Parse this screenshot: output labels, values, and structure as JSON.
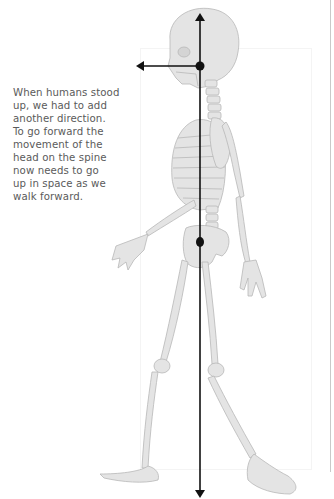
{
  "caption": {
    "text": "When humans stood\nup, we had to add\nanother direction.\nTo go forward the\nmovement of the\nhead on the spine\nnow needs to go\nup in space as we\nwalk forward."
  },
  "figure": {
    "bone_color": "#e2e2e2",
    "bone_outline": "#b8b8b8",
    "arrow_color": "#111111",
    "vertical_axis": {
      "x": 200,
      "top_y": 15,
      "bottom_y": 496
    },
    "horizontal_arrow": {
      "from_x": 200,
      "to_x": 138,
      "y": 66
    },
    "markers": [
      {
        "name": "head-pivot",
        "x": 200,
        "y": 66
      },
      {
        "name": "pelvis-center",
        "x": 200,
        "y": 242
      }
    ]
  }
}
